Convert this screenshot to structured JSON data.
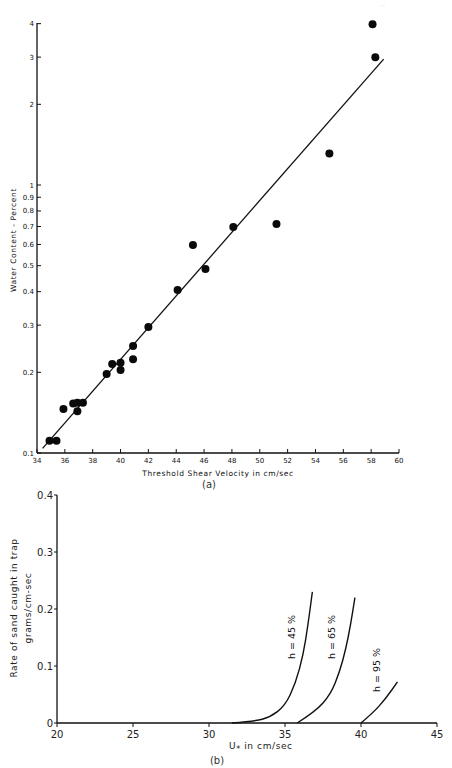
{
  "header": {
    "faint_text": "..."
  },
  "chart_data": [
    {
      "id": "a",
      "type": "scatter",
      "caption": "(a)",
      "title": "",
      "xlabel": "Threshold Shear Velocity in cm/sec",
      "ylabel": "Water Content - Percent",
      "xlim": [
        34,
        60
      ],
      "ylim": [
        0.1,
        4
      ],
      "yscale": "log",
      "grid": false,
      "legend": null,
      "x_ticks": [
        "34",
        "36",
        "38",
        "40",
        "42",
        "44",
        "46",
        "48",
        "50",
        "52",
        "54",
        "56",
        "58",
        "60"
      ],
      "y_ticks": [
        "0.1",
        "0.2",
        "0.3",
        "0.4",
        "0.5",
        "0.6",
        "0.7",
        "0.8",
        "0.9",
        "1",
        "2",
        "3",
        "4"
      ],
      "points": [
        {
          "x": 34.9,
          "y": 0.111
        },
        {
          "x": 35.4,
          "y": 0.111
        },
        {
          "x": 35.9,
          "y": 0.146
        },
        {
          "x": 36.6,
          "y": 0.153
        },
        {
          "x": 36.9,
          "y": 0.154
        },
        {
          "x": 37.3,
          "y": 0.154
        },
        {
          "x": 36.9,
          "y": 0.143
        },
        {
          "x": 39.0,
          "y": 0.197
        },
        {
          "x": 39.4,
          "y": 0.215
        },
        {
          "x": 40.0,
          "y": 0.217
        },
        {
          "x": 40.0,
          "y": 0.204
        },
        {
          "x": 40.9,
          "y": 0.251
        },
        {
          "x": 40.9,
          "y": 0.224
        },
        {
          "x": 42.0,
          "y": 0.295
        },
        {
          "x": 44.1,
          "y": 0.406
        },
        {
          "x": 45.2,
          "y": 0.597
        },
        {
          "x": 46.1,
          "y": 0.486
        },
        {
          "x": 48.1,
          "y": 0.697
        },
        {
          "x": 51.2,
          "y": 0.715
        },
        {
          "x": 55.0,
          "y": 1.31
        },
        {
          "x": 58.1,
          "y": 3.98
        },
        {
          "x": 58.3,
          "y": 3.0
        }
      ],
      "fit_line": {
        "x": [
          34.4,
          58.9
        ],
        "y": [
          0.104,
          2.95
        ]
      }
    },
    {
      "id": "b",
      "type": "line",
      "caption": "(b)",
      "title": "",
      "xlabel": "U* in cm/sec",
      "xlabel_main": "U",
      "xlabel_sub": "*",
      "xlabel_rest": " in  cm/sec",
      "ylabel": "Rate of sand caught in trap",
      "ylabel2": "grams/cm-sec",
      "xlim": [
        20,
        45
      ],
      "ylim": [
        0,
        0.4
      ],
      "grid": false,
      "x_ticks": [
        "20",
        "25",
        "30",
        "35",
        "40",
        "45"
      ],
      "y_ticks": [
        "0",
        "0.1",
        "0.2",
        "0.3",
        "0.4"
      ],
      "series": [
        {
          "name": "h = 45 %",
          "x": [
            31.5,
            33.0,
            34.0,
            35.0,
            35.7,
            36.2,
            36.5,
            36.8
          ],
          "y": [
            0.0,
            0.003,
            0.01,
            0.03,
            0.07,
            0.12,
            0.17,
            0.23
          ]
        },
        {
          "name": "h = 65 %",
          "x": [
            35.8,
            37.0,
            38.0,
            38.6,
            39.0,
            39.3,
            39.6
          ],
          "y": [
            0.0,
            0.02,
            0.05,
            0.09,
            0.13,
            0.17,
            0.22
          ]
        },
        {
          "name": "h = 95 %",
          "x": [
            40.0,
            40.8,
            41.6,
            42.4
          ],
          "y": [
            0.0,
            0.018,
            0.042,
            0.072
          ]
        }
      ]
    }
  ]
}
